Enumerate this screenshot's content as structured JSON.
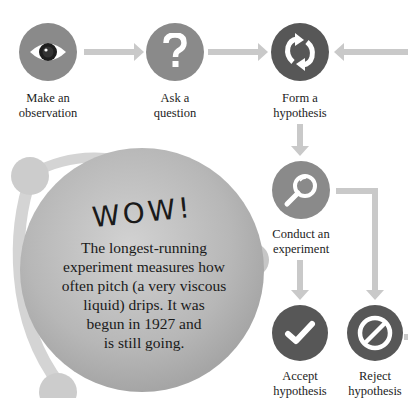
{
  "steps": [
    {
      "id": "observation",
      "label_line1": "Make an",
      "label_line2": "observation",
      "icon": "eye-icon",
      "color": "#8a8a8a"
    },
    {
      "id": "question",
      "label_line1": "Ask a",
      "label_line2": "question",
      "icon": "question-mark-icon",
      "color": "#8a8a8a"
    },
    {
      "id": "hypothesis",
      "label_line1": "Form a",
      "label_line2": "hypothesis",
      "icon": "refresh-cycle-icon",
      "color": "#575757"
    },
    {
      "id": "experiment",
      "label_line1": "Conduct an",
      "label_line2": "experiment",
      "icon": "magnifier-icon",
      "color": "#8a8a8a"
    },
    {
      "id": "accept",
      "label_line1": "Accept",
      "label_line2": "hypothesis",
      "icon": "checkmark-icon",
      "color": "#575757"
    },
    {
      "id": "reject",
      "label_line1": "Reject",
      "label_line2": "hypothesis",
      "icon": "prohibited-icon",
      "color": "#575757"
    }
  ],
  "callout": {
    "heading": "WOW!",
    "lines": [
      "The longest-running",
      "experiment measures how",
      "often pitch (a very viscous",
      "liquid) drips. It was",
      "begun in 1927 and",
      "is still going."
    ]
  },
  "colors": {
    "arrow": "#c9c9c9",
    "light_circle": "#8a8a8a",
    "dark_circle": "#575757",
    "bubble": "#b5b5b5"
  }
}
